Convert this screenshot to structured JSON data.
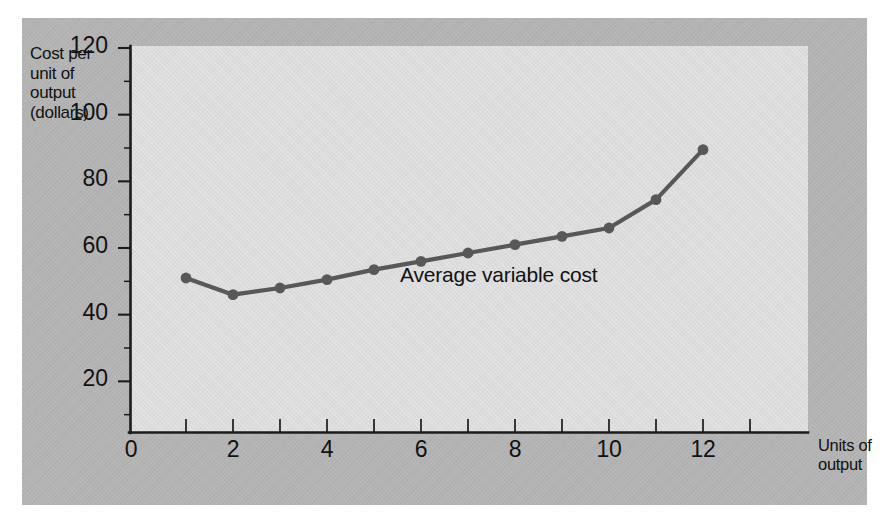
{
  "figure": {
    "panel_color": "#b4b4b4",
    "plot_bg_color": "#dcdcdc",
    "ink_color": "#111111",
    "series_color": "#585858"
  },
  "axes": {
    "y_title_line1": "Cost per",
    "y_title_line2": "unit of",
    "y_title_line3": "output",
    "y_title_line4": "(dollars)",
    "x_title_line1": "Units of",
    "x_title_line2": "output",
    "origin_label": "0",
    "y_ticks": [
      "20",
      "40",
      "60",
      "80",
      "100",
      "120"
    ],
    "x_ticks": [
      "2",
      "4",
      "6",
      "8",
      "10",
      "12"
    ]
  },
  "series_label": "Average variable cost",
  "chart_data": {
    "type": "line",
    "title": "",
    "xlabel": "Units of output",
    "ylabel": "Cost per unit of output (dollars)",
    "xlim": [
      0,
      13.6
    ],
    "ylim": [
      0,
      120
    ],
    "grid": false,
    "legend": "inline-annotation",
    "x": [
      1,
      2,
      3,
      4,
      5,
      6,
      7,
      8,
      9,
      10,
      11,
      12
    ],
    "series": [
      {
        "name": "Average variable cost",
        "color": "#585858",
        "marker": "circle",
        "values": [
          51,
          46,
          48,
          50.5,
          53.5,
          56,
          58.5,
          61,
          63.5,
          66,
          74.5,
          89.5
        ]
      }
    ],
    "y_tick_values": [
      0,
      20,
      40,
      60,
      80,
      100,
      120
    ],
    "y_minor_tick_values": [
      10,
      30,
      50,
      70,
      90,
      110
    ],
    "x_tick_values": [
      1,
      2,
      3,
      4,
      5,
      6,
      7,
      8,
      9,
      10,
      11,
      12,
      13
    ],
    "x_labeled_tick_values": [
      2,
      4,
      6,
      8,
      10,
      12
    ]
  }
}
